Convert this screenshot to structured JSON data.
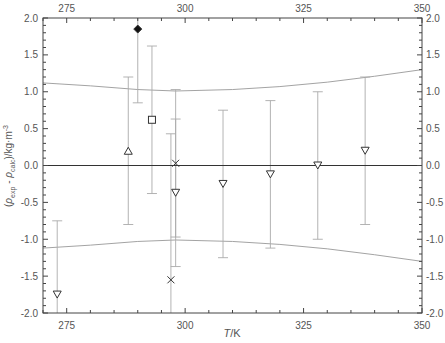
{
  "chart_data": {
    "type": "scatter",
    "title": "",
    "xlabel": "T/K",
    "ylabel": "(ρexp - ρcalc)/kg·m-3",
    "ylabel_parts": {
      "open": "(",
      "rho1": "ρ",
      "sub1": "exp",
      "minus": " - ",
      "rho2": "ρ",
      "sub2": "calc",
      "unit": ")/kg·m",
      "sup": "-3"
    },
    "xlim": [
      270,
      350
    ],
    "ylim": [
      -2.0,
      2.0
    ],
    "x_ticks": [
      275,
      300,
      325,
      350
    ],
    "x_tick_labels": [
      "275",
      "300",
      "325",
      "350"
    ],
    "y_ticks": [
      -2.0,
      -1.5,
      -1.0,
      -0.5,
      0.0,
      0.5,
      1.0,
      1.5,
      2.0
    ],
    "y_tick_labels": [
      "-2.0",
      "-1.5",
      "-1.0",
      "-0.5",
      "0.0",
      "0.5",
      "1.0",
      "1.5",
      "2.0"
    ],
    "grid": false,
    "mirror_axes": true,
    "zero_line": true,
    "series": [
      {
        "name": "down-triangle",
        "marker": "triangle-down",
        "filled": false,
        "points": [
          {
            "x": 273,
            "y": -1.75,
            "err_lo": -2.75,
            "err_hi": -0.75
          },
          {
            "x": 298,
            "y": -0.37,
            "err_lo": -1.37,
            "err_hi": 0.63
          },
          {
            "x": 308,
            "y": -0.25,
            "err_lo": -1.25,
            "err_hi": 0.75
          },
          {
            "x": 318,
            "y": -0.12,
            "err_lo": -1.12,
            "err_hi": 0.88
          },
          {
            "x": 328,
            "y": 0.0,
            "err_lo": -1.0,
            "err_hi": 1.0
          },
          {
            "x": 338,
            "y": 0.2,
            "err_lo": -0.8,
            "err_hi": 1.2
          }
        ]
      },
      {
        "name": "up-triangle",
        "marker": "triangle-up",
        "filled": false,
        "points": [
          {
            "x": 288,
            "y": 0.2,
            "err_lo": -0.8,
            "err_hi": 1.2
          }
        ]
      },
      {
        "name": "diamond",
        "marker": "diamond",
        "filled": true,
        "points": [
          {
            "x": 290,
            "y": 1.85,
            "err_lo": 0.85,
            "err_hi": 2.85
          }
        ]
      },
      {
        "name": "square",
        "marker": "square",
        "filled": false,
        "points": [
          {
            "x": 293,
            "y": 0.62,
            "err_lo": -0.38,
            "err_hi": 1.62
          }
        ]
      },
      {
        "name": "cross",
        "marker": "x",
        "filled": false,
        "points": [
          {
            "x": 297,
            "y": -1.55,
            "err_lo": -2.55,
            "err_hi": 0.43
          },
          {
            "x": 298,
            "y": 0.03,
            "err_lo": -0.97,
            "err_hi": 1.03
          }
        ]
      }
    ],
    "envelope": {
      "x": [
        270,
        280,
        290,
        298,
        310,
        320,
        330,
        340,
        350
      ],
      "upper": [
        1.12,
        1.08,
        1.03,
        1.01,
        1.03,
        1.07,
        1.13,
        1.21,
        1.3
      ],
      "lower": [
        -1.12,
        -1.08,
        -1.03,
        -1.01,
        -1.03,
        -1.07,
        -1.13,
        -1.21,
        -1.3
      ]
    }
  }
}
